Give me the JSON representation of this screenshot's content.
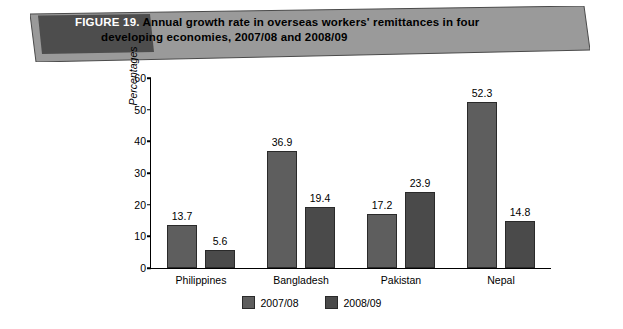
{
  "figure": {
    "label": "FIGURE 19.",
    "title_line1": "Annual growth rate in overseas workers' remittances in four",
    "title_line2": "developing economies, 2007/08 and 2008/09",
    "banner_fill": "#9a9a9a",
    "banner_label_fill": "#4d4d4d"
  },
  "chart_data": {
    "type": "bar",
    "title": "Annual growth rate in overseas workers' remittances in four developing economies, 2007/08 and 2008/09",
    "categories": [
      "Philippines",
      "Bangladesh",
      "Pakistan",
      "Nepal"
    ],
    "series": [
      {
        "name": "2007/08",
        "values": [
          13.7,
          36.9,
          17.2,
          52.3
        ],
        "color": "#5e5e5e"
      },
      {
        "name": "2008/09",
        "values": [
          5.6,
          19.4,
          23.9,
          14.8
        ],
        "color": "#4a4a4a"
      }
    ],
    "xlabel": "",
    "ylabel": "Percentages",
    "ylim": [
      0,
      60
    ],
    "yticks": [
      0,
      10,
      20,
      30,
      40,
      50,
      60
    ],
    "grid": false,
    "legend_position": "bottom"
  }
}
